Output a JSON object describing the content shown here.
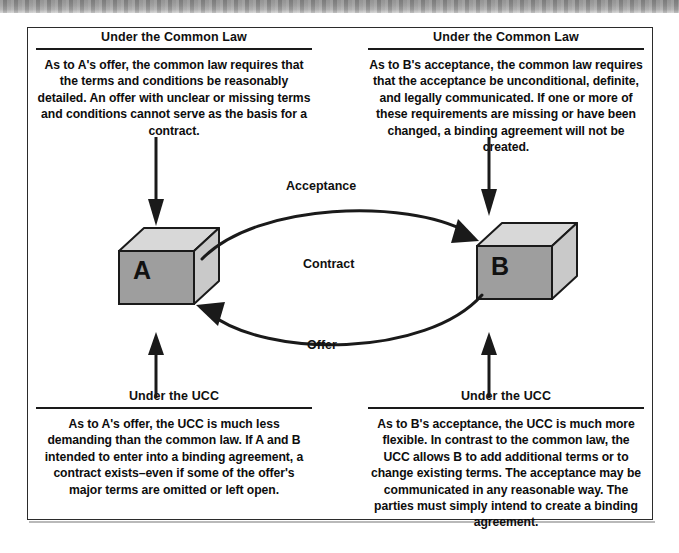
{
  "figure": {
    "type": "diagram"
  },
  "diagram": {
    "nodes": [
      {
        "id": "a",
        "label": "A",
        "name": "cube-a"
      },
      {
        "id": "b",
        "label": "B",
        "name": "cube-b"
      }
    ],
    "flows": {
      "acceptance": "Acceptance",
      "contract": "Contract",
      "offer": "Offer"
    }
  },
  "panels": {
    "top_left": {
      "heading": "Under the Common Law",
      "body": "As to A's offer, the common law requires that the terms and conditions be reasonably detailed. An offer with unclear or missing terms and conditions cannot serve as the basis for a contract."
    },
    "top_right": {
      "heading": "Under the Common Law",
      "body": "As to B's acceptance, the common law requires that the acceptance be unconditional, definite, and legally communicated. If one or more of these requirements are missing or have been changed, a binding agreement will not be created."
    },
    "bottom_left": {
      "heading": "Under the UCC",
      "body": "As to A's offer, the  UCC is much less demanding than the common law. If A and B intended to enter into a binding agreement, a contract exists–even if some of the  offer's major terms are omitted  or left open."
    },
    "bottom_right": {
      "heading": "Under the UCC",
      "body": "As to B's acceptance, the  UCC is much more flexible.  In contrast to the common law, the UCC allows B to add additional terms or to change existing terms. The acceptance may be communicated in any reasonable way. The parties must simply intend to create a binding agreement."
    }
  },
  "colors": {
    "cube_front": "#9e9e9e",
    "cube_top": "#d8d8d8",
    "cube_side": "#c8c8c8",
    "stroke": "#1a1a1a",
    "frame": "#2b2b2b",
    "text": "#0d0d0d"
  }
}
